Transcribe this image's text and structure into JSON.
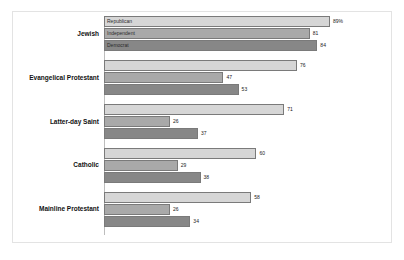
{
  "chart_data": {
    "type": "bar",
    "orientation": "horizontal",
    "title": "",
    "subtitle": "",
    "xlabel": "",
    "ylabel": "",
    "xlim": [
      0,
      100
    ],
    "grid": false,
    "legend_position": "in-bars-first-group",
    "value_suffix_first": "%",
    "categories": [
      "Jewish",
      "Evangelical Protestant",
      "Latter-day Saint",
      "Catholic",
      "Mainline Protestant"
    ],
    "series": [
      {
        "name": "Republican",
        "color": "#d6d6d6",
        "values": [
          89,
          76,
          71,
          60,
          58
        ],
        "labels": [
          "89%",
          "76",
          "71",
          "60",
          "58"
        ]
      },
      {
        "name": "Independent",
        "color": "#a9a9a9",
        "values": [
          81,
          47,
          26,
          29,
          26
        ],
        "labels": [
          "81",
          "47",
          "26",
          "29",
          "26"
        ]
      },
      {
        "name": "Democrat",
        "color": "#878787",
        "values": [
          84,
          53,
          37,
          38,
          34
        ],
        "labels": [
          "84",
          "53",
          "37",
          "38",
          "34"
        ]
      }
    ]
  },
  "colors": {
    "republican": "#d6d6d6",
    "independent": "#a9a9a9",
    "democrat": "#878787",
    "bar_outline": "#7a7a7a",
    "axis": "#bdbdbd",
    "frame": "#e3e3e3",
    "background": "#ffffff"
  }
}
